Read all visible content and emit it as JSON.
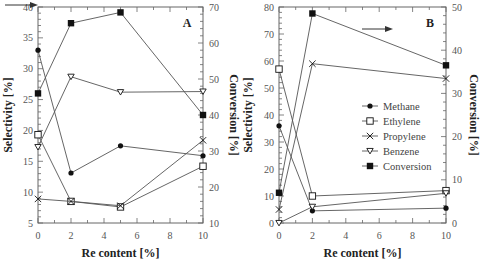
{
  "chart_data": [
    {
      "type": "line",
      "panel_label": "A",
      "title": "",
      "xlabel": "Re content [%]",
      "ylabel": "Selectivity [%]",
      "y2label": "Conversion [%]",
      "x": [
        0,
        2,
        5,
        10
      ],
      "xticks": [
        0,
        2,
        4,
        6,
        8,
        10
      ],
      "xlim": [
        0,
        10
      ],
      "ylim": [
        5,
        40
      ],
      "yticks": [
        5,
        10,
        15,
        20,
        25,
        30,
        35,
        40
      ],
      "y2lim": [
        10,
        70
      ],
      "y2ticks": [
        10,
        20,
        30,
        40,
        50,
        60,
        70
      ],
      "grid": false,
      "annotation": "arrow pointing to right axis (Conversion) at top-left",
      "series": [
        {
          "name": "Methane",
          "marker": "filled-circle",
          "axis": "left",
          "values": [
            33.0,
            13.1,
            17.5,
            15.9
          ]
        },
        {
          "name": "Ethylene",
          "marker": "open-square",
          "axis": "left",
          "values": [
            19.3,
            8.5,
            7.6,
            14.2
          ]
        },
        {
          "name": "Propylene",
          "marker": "x",
          "axis": "left",
          "values": [
            8.9,
            8.5,
            7.8,
            18.4
          ]
        },
        {
          "name": "Benzene",
          "marker": "open-down-triangle",
          "axis": "left",
          "values": [
            17.3,
            28.7,
            26.2,
            26.3
          ]
        },
        {
          "name": "Conversion",
          "marker": "filled-square",
          "axis": "right",
          "values": [
            46,
            65.5,
            68.5,
            40
          ]
        }
      ]
    },
    {
      "type": "line",
      "panel_label": "B",
      "title": "",
      "xlabel": "Re content [%]",
      "ylabel": "Selectivity [%]",
      "y2label": "Conversion [%]",
      "x": [
        0,
        2,
        10
      ],
      "xticks": [
        0,
        2,
        4,
        6,
        8,
        10
      ],
      "xlim": [
        0,
        10
      ],
      "ylim": [
        0,
        80
      ],
      "yticks": [
        0,
        10,
        20,
        30,
        40,
        50,
        60,
        70,
        80
      ],
      "y2lim": [
        0,
        50
      ],
      "y2ticks": [
        0,
        10,
        20,
        30,
        40,
        50
      ],
      "grid": false,
      "annotation": "arrow pointing right toward Conversion axis",
      "legend_position": "center-right",
      "series": [
        {
          "name": "Methane",
          "marker": "filled-circle",
          "axis": "left",
          "values": [
            36,
            4.5,
            5.5
          ]
        },
        {
          "name": "Ethylene",
          "marker": "open-square",
          "axis": "left",
          "values": [
            57,
            10,
            12
          ]
        },
        {
          "name": "Propylene",
          "marker": "x",
          "axis": "left",
          "values": [
            5,
            59,
            53.5
          ]
        },
        {
          "name": "Benzene",
          "marker": "open-down-triangle",
          "axis": "left",
          "values": [
            0,
            6,
            11
          ]
        },
        {
          "name": "Conversion",
          "marker": "filled-square",
          "axis": "right",
          "values": [
            7,
            48.5,
            36.5
          ]
        }
      ]
    }
  ],
  "legend": {
    "items": [
      "Methane",
      "Ethylene",
      "Propylene",
      "Benzene",
      "Conversion"
    ]
  },
  "colors": {
    "line": "#555555",
    "marker": "#111111",
    "axis": "#666666"
  }
}
